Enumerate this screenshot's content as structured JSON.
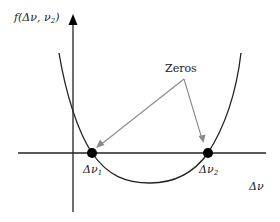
{
  "diagram": {
    "y_axis_label": {
      "prefix": "f(Δν, ν",
      "sub": "2",
      "suffix": ")"
    },
    "x_axis_label": "Δν",
    "callout_label": "Zeros",
    "zeros": [
      {
        "symbol": "Δν",
        "sub": "1"
      },
      {
        "symbol": "Δν",
        "sub": "2"
      }
    ],
    "colors": {
      "axis": "#222222",
      "curve": "#222222",
      "arrow": "#8a8a8a",
      "point": "#000000"
    }
  }
}
